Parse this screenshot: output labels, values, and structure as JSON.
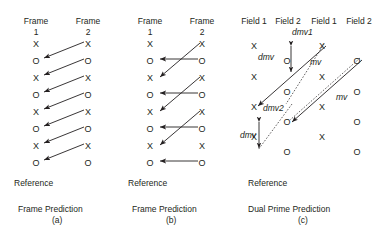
{
  "figure": {
    "symbol_x": "X",
    "symbol_o": "O"
  },
  "panel_a": {
    "header_left_line1": "Frame",
    "header_left_line2": "1",
    "header_right_line1": "Frame",
    "header_right_line2": "2",
    "reference_label": "Reference",
    "caption_line1": "Frame Prediction",
    "caption_line2": "(a)",
    "left_column_symbols": [
      "X",
      "O",
      "X",
      "O",
      "X",
      "O",
      "X",
      "O"
    ],
    "right_column_symbols": [
      "X",
      "O",
      "X",
      "O",
      "X",
      "O",
      "X",
      "O"
    ],
    "arrow_count": 7
  },
  "panel_b": {
    "header_left_line1": "Frame",
    "header_left_line2": "1",
    "header_right_line1": "Frame",
    "header_right_line2": "2",
    "reference_label": "Reference",
    "caption_line1": "Frame Prediction",
    "caption_line2": "(b)",
    "left_column_symbols": [
      "X",
      "O",
      "X",
      "O",
      "X",
      "O",
      "X",
      "O"
    ],
    "right_column_symbols": [
      "X",
      "O",
      "X",
      "O",
      "X",
      "O",
      "X",
      "O"
    ],
    "horizontal_arrow_count": 4,
    "diagonal_arrow_count": 3
  },
  "panel_c": {
    "header_1": "Field 1",
    "header_2": "Field 2",
    "header_3": "Field 1",
    "header_4": "Field 2",
    "reference_label": "Reference",
    "caption_line1": "Dual Prime Prediction",
    "caption_line2": "(c)",
    "column1_symbols": [
      "X",
      "X",
      "X",
      "X"
    ],
    "column2_symbols": [
      "O",
      "O",
      "O",
      "O"
    ],
    "column3_symbols": [
      "X",
      "X",
      "X",
      "X"
    ],
    "column4_symbols": [
      "O",
      "O",
      "O",
      "O"
    ],
    "labels": {
      "dmv1": "dmv1",
      "dmv2": "dmv2",
      "dmv": "dmv",
      "dmv_lower": "dmv",
      "mv_upper": "mv",
      "mv_lower": "mv"
    }
  }
}
